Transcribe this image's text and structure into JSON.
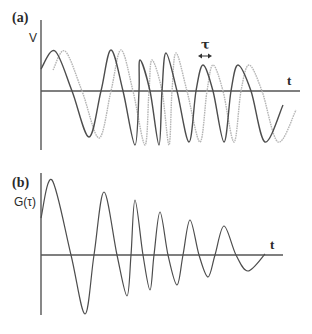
{
  "panels": {
    "a": {
      "tag": "(a)",
      "ylabel": "V",
      "xlabel": "t",
      "delay_label": "τ",
      "axis": {
        "x0": 41,
        "y_top": 20,
        "y_bottom": 150,
        "baseline": 91,
        "x_end": 300
      },
      "signal_dark": {
        "color": "#4d4d4d",
        "points": [
          [
            41,
            69
          ],
          [
            55,
            51
          ],
          [
            72,
            91
          ],
          [
            89,
            137
          ],
          [
            101,
            91
          ],
          [
            111,
            50
          ],
          [
            123,
            91
          ],
          [
            135,
            145
          ],
          [
            139,
            91
          ],
          [
            140,
            60
          ],
          [
            150,
            91
          ],
          [
            159,
            145
          ],
          [
            162,
            91
          ],
          [
            166,
            53
          ],
          [
            177,
            91
          ],
          [
            189,
            142
          ],
          [
            196,
            91
          ],
          [
            203,
            65
          ],
          [
            213,
            91
          ],
          [
            224,
            142
          ],
          [
            231,
            91
          ],
          [
            238,
            65
          ],
          [
            251,
            91
          ],
          [
            265,
            142
          ],
          [
            283,
            105
          ]
        ]
      },
      "signal_delayed": {
        "color": "#b5b5b5",
        "points": [
          [
            53,
            70
          ],
          [
            65,
            51
          ],
          [
            82,
            91
          ],
          [
            99,
            138
          ],
          [
            111,
            91
          ],
          [
            121,
            50
          ],
          [
            133,
            91
          ],
          [
            145,
            145
          ],
          [
            149,
            91
          ],
          [
            152,
            60
          ],
          [
            162,
            91
          ],
          [
            169,
            145
          ],
          [
            172,
            91
          ],
          [
            176,
            53
          ],
          [
            187,
            91
          ],
          [
            200,
            142
          ],
          [
            207,
            91
          ],
          [
            213,
            65
          ],
          [
            223,
            91
          ],
          [
            234,
            142
          ],
          [
            241,
            91
          ],
          [
            249,
            65
          ],
          [
            262,
            91
          ],
          [
            278,
            142
          ],
          [
            296,
            110
          ]
        ]
      },
      "tau_arrow": {
        "x1": 198,
        "x2": 212,
        "y": 56
      }
    },
    "b": {
      "tag": "(b)",
      "ylabel": "G(τ)",
      "xlabel": "t",
      "axis": {
        "x0": 41,
        "y_top": 173,
        "y_bottom": 315,
        "baseline": 255,
        "x_end": 283
      },
      "correlation": {
        "color": "#4d4d4d",
        "points": [
          [
            41,
            218
          ],
          [
            52,
            180
          ],
          [
            71,
            255
          ],
          [
            85,
            314
          ],
          [
            94,
            255
          ],
          [
            104,
            192
          ],
          [
            117,
            255
          ],
          [
            127,
            296
          ],
          [
            131,
            255
          ],
          [
            135,
            200
          ],
          [
            143,
            255
          ],
          [
            150,
            290
          ],
          [
            154,
            255
          ],
          [
            160,
            212
          ],
          [
            168,
            255
          ],
          [
            177,
            285
          ],
          [
            183,
            255
          ],
          [
            190,
            220
          ],
          [
            199,
            255
          ],
          [
            208,
            277
          ],
          [
            215,
            255
          ],
          [
            224,
            226
          ],
          [
            236,
            255
          ],
          [
            248,
            271
          ],
          [
            265,
            254
          ]
        ]
      }
    }
  }
}
